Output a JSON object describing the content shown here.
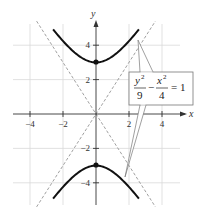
{
  "chart_data": {
    "type": "line",
    "title": "",
    "xlabel": "x",
    "ylabel": "y",
    "xlim": [
      -5,
      5
    ],
    "ylim": [
      -5,
      5
    ],
    "grid": true,
    "grid_step": 2,
    "x_ticks": [
      -4,
      -2,
      2,
      4
    ],
    "y_ticks": [
      4,
      2,
      -2,
      -4
    ],
    "x_tick_labels": [
      "−4",
      "−2",
      "2",
      "4"
    ],
    "y_tick_labels": [
      "4",
      "2",
      "−2",
      "−4"
    ],
    "series": [
      {
        "name": "hyperbola upper branch",
        "equation": "y = 3*sqrt(1 + x^2/4)",
        "style": "solid-thick",
        "x_range": [
          -2.6,
          2.6
        ]
      },
      {
        "name": "hyperbola lower branch",
        "equation": "y = -3*sqrt(1 + x^2/4)",
        "style": "solid-thick",
        "x_range": [
          -2.6,
          2.6
        ]
      },
      {
        "name": "asymptote positive",
        "equation": "y = 1.5x",
        "style": "dashed"
      },
      {
        "name": "asymptote negative",
        "equation": "y = -1.5x",
        "style": "dashed"
      }
    ],
    "points": [
      {
        "label": "vertex upper",
        "x": 0,
        "y": 3
      },
      {
        "label": "vertex lower",
        "x": 0,
        "y": -3
      }
    ],
    "annotations": [
      {
        "text": "y²/9 − x²/4 = 1",
        "position": "right",
        "callout_targets": [
          "upper branch",
          "lower branch"
        ]
      }
    ]
  },
  "axes": {
    "x_label": "x",
    "y_label": "y",
    "x_ticks": [
      "−4",
      "−2",
      "2",
      "4"
    ],
    "y_ticks": [
      "4",
      "2",
      "−2",
      "−4"
    ]
  },
  "equation": {
    "num1": "y",
    "exp1": "2",
    "den1": "9",
    "minus": "−",
    "num2": "x",
    "exp2": "2",
    "den2": "4",
    "equals": "= 1"
  },
  "colors": {
    "curve": "#111111",
    "grid": "#d9d9d9",
    "axis": "#333333",
    "asymptote": "#888888"
  }
}
